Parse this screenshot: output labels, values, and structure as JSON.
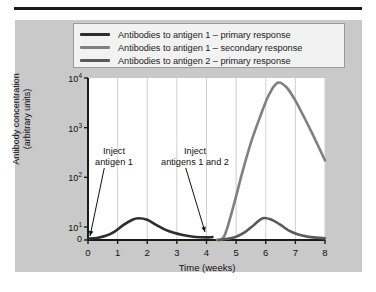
{
  "figure": {
    "name": "antibody-response-primary-secondary-chart",
    "panel_color": "#c9c9c9",
    "plot_background": "#ffffff"
  },
  "legend": {
    "position": "top",
    "entries": [
      {
        "label": "Antibodies to antigen 1 – primary response",
        "color": "#2e2e2e"
      },
      {
        "label": "Antibodies to antigen 1 – secondary response",
        "color": "#808080"
      },
      {
        "label": "Antibodies to antigen 2 – primary response",
        "color": "#5a5a5a"
      }
    ]
  },
  "annotations": {
    "inject1": {
      "line1": "Inject",
      "line2": "antigen 1"
    },
    "inject2": {
      "line1": "Inject",
      "line2": "antigens 1 and 2"
    }
  },
  "chart_data": {
    "type": "line",
    "title": "",
    "xlabel": "Time (weeks)",
    "ylabel": "Antibody concentration\n(arbitrary units)",
    "ylabel_line1": "Antibody concentration",
    "ylabel_line2": "(arbitrary units)",
    "yscale": "log",
    "ylim": [
      0,
      10000
    ],
    "xlim": [
      0,
      8
    ],
    "grid": "vertical",
    "xticks": [
      "0",
      "1",
      "2",
      "3",
      "4",
      "5",
      "6",
      "7",
      "8"
    ],
    "xtick_values": [
      0,
      1,
      2,
      3,
      4,
      5,
      6,
      7,
      8
    ],
    "yticks": [
      "0",
      "10¹",
      "10²",
      "10³",
      "10⁴"
    ],
    "ytick_values": [
      0,
      10,
      100,
      1000,
      10000
    ],
    "ytick_bases": [
      "0",
      "10",
      "10",
      "10",
      "10"
    ],
    "ytick_exps": [
      "",
      "1",
      "2",
      "3",
      "4"
    ],
    "series": [
      {
        "name": "Antibodies to antigen 1 – primary response",
        "color": "#2e2e2e",
        "x": [
          0,
          0.3,
          0.6,
          0.9,
          1.2,
          1.5,
          1.7,
          2.0,
          2.3,
          2.6,
          2.9,
          3.2,
          3.5,
          3.8,
          4.0,
          4.2
        ],
        "y": [
          1.0,
          1.6,
          3.2,
          6.5,
          11.0,
          14.0,
          15.0,
          14.0,
          11.0,
          8.0,
          5.5,
          3.8,
          2.7,
          2.1,
          2.0,
          2.2
        ]
      },
      {
        "name": "Antibodies to antigen 1 – secondary response",
        "color": "#808080",
        "x": [
          4.35,
          4.6,
          4.9,
          5.2,
          5.5,
          5.8,
          6.1,
          6.4,
          6.7,
          7.0,
          7.3,
          7.6,
          8.0
        ],
        "y": [
          0.0,
          3.0,
          25.0,
          120.0,
          500.0,
          1600.0,
          4500.0,
          8000.0,
          6500.0,
          3500.0,
          1600.0,
          700.0,
          220.0
        ]
      },
      {
        "name": "Antibodies to antigen 2 – primary response",
        "color": "#5a5a5a",
        "x": [
          4.4,
          4.7,
          5.0,
          5.3,
          5.6,
          5.9,
          6.2,
          6.5,
          6.8,
          7.1,
          7.4,
          7.7,
          8.0
        ],
        "y": [
          0.0,
          0.9,
          2.5,
          6.0,
          11.0,
          15.0,
          14.0,
          11.0,
          7.0,
          4.2,
          2.6,
          1.8,
          1.4
        ]
      }
    ],
    "arrows": [
      {
        "name": "inject-antigen-1-arrow",
        "from_x": 0.55,
        "from_y_px": 168,
        "to_x": 0.07,
        "to_y_px": 236
      },
      {
        "name": "inject-antigens-1-and-2-arrow",
        "from_x": 3.3,
        "from_y_px": 168,
        "to_x": 3.95,
        "to_y_px": 232
      }
    ]
  }
}
